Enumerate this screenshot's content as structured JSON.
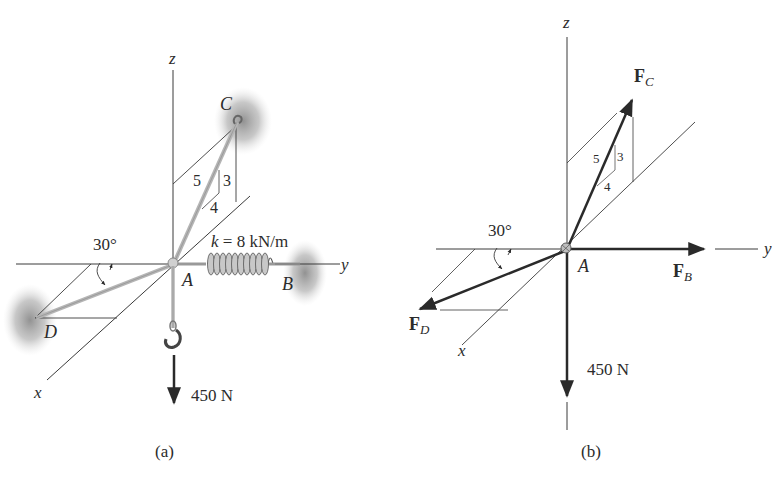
{
  "figure_a": {
    "caption": "(a)",
    "axis_labels": {
      "x": "x",
      "y": "y",
      "z": "z"
    },
    "points": {
      "A": "A",
      "B": "B",
      "C": "C",
      "D": "D"
    },
    "slope_triangle": {
      "hyp": "5",
      "vert": "3",
      "horiz": "4"
    },
    "angle_label": "30°",
    "spring_label_k": "k",
    "spring_label_value": " = 8 kN/m",
    "load_label": "450 N"
  },
  "figure_b": {
    "caption": "(b)",
    "axis_labels": {
      "x": "x",
      "y": "y",
      "z": "z"
    },
    "point_A": "A",
    "slope_triangle": {
      "hyp": "5",
      "vert": "3",
      "horiz": "4"
    },
    "angle_label": "30°",
    "forces": {
      "FC": {
        "main": "F",
        "sub": "C"
      },
      "FB": {
        "main": "F",
        "sub": "B"
      },
      "FD": {
        "main": "F",
        "sub": "D"
      }
    },
    "load_label": "450 N"
  },
  "colors": {
    "line": "#3a3a3a",
    "arrow": "#2a2a2a",
    "cable": "#b8b8b8",
    "support_shadow": "#8a8a8a"
  }
}
